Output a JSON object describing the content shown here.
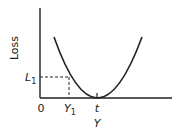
{
  "diagram": {
    "y_axis_label": "Loss",
    "x_axis_label": "Y",
    "origin_label": "0",
    "target_label": "t",
    "point_x_label": "Y",
    "point_x_subscript": "1",
    "point_y_label": "L",
    "point_y_subscript": "1",
    "colors": {
      "stroke": "#222222",
      "background": "#ffffff"
    }
  }
}
